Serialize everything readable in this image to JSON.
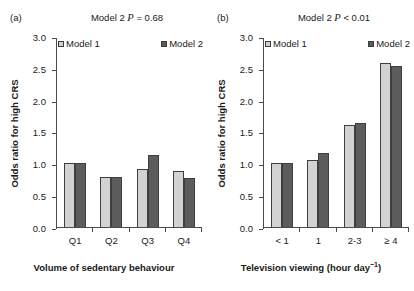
{
  "figure": {
    "ylabel": "Odds ratio for high CRS",
    "legend_labels": [
      "Model 1",
      "Model 2"
    ],
    "colors": {
      "model1": "#d2d2d2",
      "model2": "#5c5c5c",
      "axis": "#4a4a4a",
      "background": "#ffffff"
    }
  },
  "panels": [
    {
      "letter": "(a)",
      "note_prefix": "Model 2 ",
      "note_italic": "P",
      "note_suffix": " = 0.68",
      "xlabel": "Volume of sedentary behaviour",
      "xlabel_sup": "",
      "ylabel": "Odds ratio for high CRS",
      "ytick_labels": [
        "3.0",
        "2.5",
        "2.0",
        "1.5",
        "1.0",
        "0.5",
        "0.0"
      ],
      "xtick_labels": [
        "Q1",
        "Q2",
        "Q3",
        "Q4"
      ]
    },
    {
      "letter": "(b)",
      "note_prefix": "Model 2 ",
      "note_italic": "P",
      "note_suffix": " < 0.01",
      "xlabel": "Television viewing (hour day",
      "xlabel_sup": "−1",
      "xlabel_tail": ")",
      "ylabel": "Odds ratio for high CRS",
      "ytick_labels": [
        "3.0",
        "2.5",
        "2.0",
        "1.5",
        "1.0",
        "0.5",
        "0.0"
      ],
      "xtick_labels": [
        "< 1",
        "1",
        "2-3",
        "≥ 4"
      ]
    }
  ],
  "chart_data": [
    {
      "type": "bar",
      "panel": "(a)",
      "title": "Model 2 P = 0.68",
      "xlabel": "Volume of sedentary behaviour",
      "ylabel": "Odds ratio for high CRS",
      "categories": [
        "Q1",
        "Q2",
        "Q3",
        "Q4"
      ],
      "series": [
        {
          "name": "Model 1",
          "values": [
            1.0,
            0.79,
            0.91,
            0.88
          ],
          "color": "#d2d2d2"
        },
        {
          "name": "Model 2",
          "values": [
            1.0,
            0.78,
            1.14,
            0.77
          ],
          "color": "#5c5c5c"
        }
      ],
      "ylim": [
        0,
        3.0
      ],
      "yticks": [
        0.0,
        0.5,
        1.0,
        1.5,
        2.0,
        2.5,
        3.0
      ],
      "grid": false,
      "legend_position": "top",
      "annotations": [
        "Model 2 P = 0.68"
      ]
    },
    {
      "type": "bar",
      "panel": "(b)",
      "title": "Model 2 P < 0.01",
      "xlabel": "Television viewing (hour day⁻¹)",
      "ylabel": "Odds ratio for high CRS",
      "categories": [
        "< 1",
        "1",
        "2-3",
        "≥ 4"
      ],
      "series": [
        {
          "name": "Model 1",
          "values": [
            1.0,
            1.06,
            1.6,
            2.58
          ],
          "color": "#d2d2d2"
        },
        {
          "name": "Model 2",
          "values": [
            1.0,
            1.16,
            1.63,
            2.53
          ],
          "color": "#5c5c5c"
        }
      ],
      "ylim": [
        0,
        3.0
      ],
      "yticks": [
        0.0,
        0.5,
        1.0,
        1.5,
        2.0,
        2.5,
        3.0
      ],
      "grid": false,
      "legend_position": "top",
      "annotations": [
        "Model 2 P < 0.01"
      ]
    }
  ]
}
